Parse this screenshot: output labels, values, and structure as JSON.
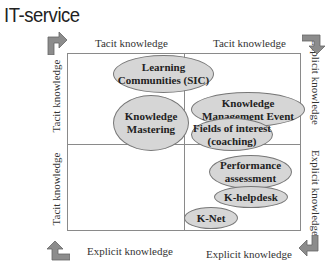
{
  "title": "IT-service",
  "axes": {
    "top_left": "Tacit knowledge",
    "top_right": "Tacit knowledge",
    "bottom_left": "Explicit knowledge",
    "bottom_right": "Explicit knowledge",
    "left_upper": "Tacit knowledge",
    "left_lower": "Tacit knowledge",
    "right_upper": "Explicit knowledge",
    "right_lower": "Explicit knowledge"
  },
  "items": [
    {
      "label": "Learning\nCommunities (SIC)",
      "line1": "Learning",
      "line2": "Communities (SIC)"
    },
    {
      "label": "Knowledge Mastering",
      "line1": "Knowledge",
      "line2": "Mastering"
    },
    {
      "label": "Knowledge Management Event",
      "line1": "Knowledge",
      "line2": "Management Event"
    },
    {
      "label": "Fields of interest (coaching)",
      "line1": "Fields of interest",
      "line2": "(coaching)"
    },
    {
      "label": "Performance assessment",
      "line1": "Performance",
      "line2": "assessment"
    },
    {
      "label": "K-helpdesk",
      "line1": "K-helpdesk"
    },
    {
      "label": "K-Net",
      "line1": "K-Net"
    }
  ],
  "icons": {
    "top_left": "turn-right-arrow-icon",
    "top_right": "turn-down-arrow-icon",
    "bottom_right": "turn-left-arrow-icon",
    "bottom_left": "turn-up-arrow-icon"
  },
  "colors": {
    "ellipse_fill": "#d6d6d6",
    "arrow_fill": "#8c8c8c",
    "grid_line": "#8a8a8a"
  }
}
